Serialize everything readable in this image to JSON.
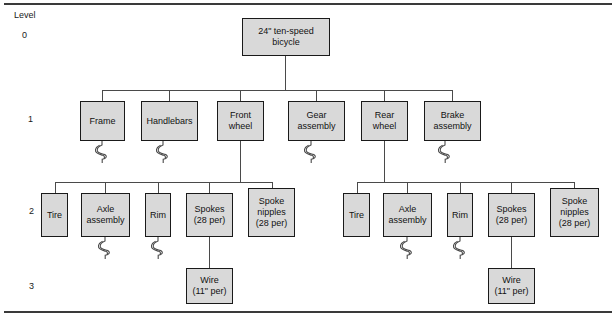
{
  "diagram": {
    "type": "product-structure-tree",
    "level_header": "Level",
    "levels": [
      {
        "id": "level-0",
        "label": "0",
        "x": 22,
        "y": 30
      },
      {
        "id": "level-1",
        "label": "1",
        "x": 28,
        "y": 114
      },
      {
        "id": "level-2",
        "label": "2",
        "x": 29,
        "y": 206
      },
      {
        "id": "level-3",
        "label": "3",
        "x": 29,
        "y": 281
      }
    ],
    "level_header_pos": {
      "x": 14,
      "y": 10
    },
    "nodes": [
      {
        "id": "root-bicycle",
        "name": "node-24in-ten-speed-bicycle",
        "label": "24\" ten-speed\nbicycle",
        "level": 0,
        "x": 242,
        "y": 18,
        "w": 88,
        "h": 38
      },
      {
        "id": "frame",
        "name": "node-frame",
        "label": "Frame",
        "level": 1,
        "x": 80,
        "y": 101,
        "w": 45,
        "h": 40
      },
      {
        "id": "handlebars",
        "name": "node-handlebars",
        "label": "Handlebars",
        "level": 1,
        "x": 141,
        "y": 101,
        "w": 57,
        "h": 40
      },
      {
        "id": "front-wheel",
        "name": "node-front-wheel",
        "label": "Front\nwheel",
        "level": 1,
        "x": 217,
        "y": 101,
        "w": 47,
        "h": 40
      },
      {
        "id": "gear-assembly",
        "name": "node-gear-assembly",
        "label": "Gear\nassembly",
        "level": 1,
        "x": 288,
        "y": 101,
        "w": 57,
        "h": 40
      },
      {
        "id": "rear-wheel",
        "name": "node-rear-wheel",
        "label": "Rear\nwheel",
        "level": 1,
        "x": 361,
        "y": 101,
        "w": 47,
        "h": 40
      },
      {
        "id": "brake-assembly",
        "name": "node-brake-assembly",
        "label": "Brake\nassembly",
        "level": 1,
        "x": 424,
        "y": 101,
        "w": 57,
        "h": 40
      },
      {
        "id": "tire-l",
        "name": "node-tire-front",
        "label": "Tire",
        "level": 2,
        "x": 41,
        "y": 193,
        "w": 27,
        "h": 44
      },
      {
        "id": "axle-l",
        "name": "node-axle-assembly-front",
        "label": "Axle\nassembly",
        "level": 2,
        "x": 81,
        "y": 193,
        "w": 49,
        "h": 44
      },
      {
        "id": "rim-l",
        "name": "node-rim-front",
        "label": "Rim",
        "level": 2,
        "x": 145,
        "y": 193,
        "w": 26,
        "h": 44
      },
      {
        "id": "spokes-l",
        "name": "node-spokes-front",
        "label": "Spokes\n(28 per)",
        "level": 2,
        "x": 186,
        "y": 193,
        "w": 47,
        "h": 44
      },
      {
        "id": "spoke-nipples-l",
        "name": "node-spoke-nipples-front",
        "label": "Spoke\nnipples\n(28 per)",
        "level": 2,
        "x": 248,
        "y": 188,
        "w": 47,
        "h": 49
      },
      {
        "id": "tire-r",
        "name": "node-tire-rear",
        "label": "Tire",
        "level": 2,
        "x": 343,
        "y": 193,
        "w": 27,
        "h": 44
      },
      {
        "id": "axle-r",
        "name": "node-axle-assembly-rear",
        "label": "Axle\nassembly",
        "level": 2,
        "x": 383,
        "y": 193,
        "w": 49,
        "h": 44
      },
      {
        "id": "rim-r",
        "name": "node-rim-rear",
        "label": "Rim",
        "level": 2,
        "x": 447,
        "y": 193,
        "w": 26,
        "h": 44
      },
      {
        "id": "spokes-r",
        "name": "node-spokes-rear",
        "label": "Spokes\n(28 per)",
        "level": 2,
        "x": 488,
        "y": 193,
        "w": 47,
        "h": 44
      },
      {
        "id": "spoke-nipples-r",
        "name": "node-spoke-nipples-rear",
        "label": "Spoke\nnipples\n(28 per)",
        "level": 2,
        "x": 550,
        "y": 188,
        "w": 49,
        "h": 49
      },
      {
        "id": "wire-l",
        "name": "node-wire-front",
        "label": "Wire\n(11\" per)",
        "level": 3,
        "x": 186,
        "y": 268,
        "w": 47,
        "h": 36
      },
      {
        "id": "wire-r",
        "name": "node-wire-rear",
        "label": "Wire\n(11\" per)",
        "level": 3,
        "x": 488,
        "y": 268,
        "w": 47,
        "h": 36
      }
    ],
    "edges": [
      {
        "id": "e-root-stem",
        "name": "edge-root-stem",
        "orient": "v",
        "x": 285,
        "y": 56,
        "len": 34
      },
      {
        "id": "e-bus-l1",
        "name": "edge-level1-bus",
        "orient": "h",
        "x": 102,
        "y": 90,
        "len": 351
      },
      {
        "id": "e-frame",
        "name": "edge-to-frame",
        "orient": "v",
        "x": 102,
        "y": 90,
        "len": 11
      },
      {
        "id": "e-handlebars",
        "name": "edge-to-handlebars",
        "orient": "v",
        "x": 169,
        "y": 90,
        "len": 11
      },
      {
        "id": "e-front-wheel",
        "name": "edge-to-front-wheel",
        "orient": "v",
        "x": 240,
        "y": 90,
        "len": 11
      },
      {
        "id": "e-gear",
        "name": "edge-to-gear-assembly",
        "orient": "v",
        "x": 316,
        "y": 90,
        "len": 11
      },
      {
        "id": "e-rear-wheel",
        "name": "edge-to-rear-wheel",
        "orient": "v",
        "x": 384,
        "y": 90,
        "len": 11
      },
      {
        "id": "e-brake",
        "name": "edge-to-brake-assembly",
        "orient": "v",
        "x": 452,
        "y": 90,
        "len": 11
      },
      {
        "id": "e-fw-stem",
        "name": "edge-front-wheel-stem",
        "orient": "v",
        "x": 240,
        "y": 141,
        "len": 41
      },
      {
        "id": "e-bus-l2a",
        "name": "edge-level2-bus-front",
        "orient": "h",
        "x": 55,
        "y": 182,
        "len": 218
      },
      {
        "id": "e-tire-l",
        "name": "edge-to-tire-front",
        "orient": "v",
        "x": 55,
        "y": 182,
        "len": 12
      },
      {
        "id": "e-axle-l",
        "name": "edge-to-axle-front",
        "orient": "v",
        "x": 105,
        "y": 182,
        "len": 12
      },
      {
        "id": "e-rim-l",
        "name": "edge-to-rim-front",
        "orient": "v",
        "x": 158,
        "y": 182,
        "len": 12
      },
      {
        "id": "e-spokes-l",
        "name": "edge-to-spokes-front",
        "orient": "v",
        "x": 209,
        "y": 182,
        "len": 12
      },
      {
        "id": "e-nipples-l",
        "name": "edge-to-nipples-front",
        "orient": "v",
        "x": 272,
        "y": 182,
        "len": 7
      },
      {
        "id": "e-wire-l",
        "name": "edge-to-wire-front",
        "orient": "v",
        "x": 209,
        "y": 237,
        "len": 32
      },
      {
        "id": "e-rw-stem",
        "name": "edge-rear-wheel-stem",
        "orient": "v",
        "x": 384,
        "y": 141,
        "len": 41
      },
      {
        "id": "e-bus-l2b",
        "name": "edge-level2-bus-rear",
        "orient": "h",
        "x": 357,
        "y": 182,
        "len": 218
      },
      {
        "id": "e-tire-r",
        "name": "edge-to-tire-rear",
        "orient": "v",
        "x": 357,
        "y": 182,
        "len": 12
      },
      {
        "id": "e-axle-r",
        "name": "edge-to-axle-rear",
        "orient": "v",
        "x": 407,
        "y": 182,
        "len": 12
      },
      {
        "id": "e-rim-r",
        "name": "edge-to-rim-rear",
        "orient": "v",
        "x": 460,
        "y": 182,
        "len": 12
      },
      {
        "id": "e-spokes-r",
        "name": "edge-to-spokes-rear",
        "orient": "v",
        "x": 511,
        "y": 182,
        "len": 12
      },
      {
        "id": "e-nipples-r",
        "name": "edge-to-nipples-rear",
        "orient": "v",
        "x": 574,
        "y": 182,
        "len": 7
      },
      {
        "id": "e-wire-r",
        "name": "edge-to-wire-rear",
        "orient": "v",
        "x": 511,
        "y": 237,
        "len": 32
      }
    ],
    "break_marks": [
      {
        "id": "bm-frame",
        "name": "break-symbol-frame",
        "x": 95,
        "y": 141
      },
      {
        "id": "bm-handlebars",
        "name": "break-symbol-handlebars",
        "x": 156,
        "y": 141
      },
      {
        "id": "bm-gear",
        "name": "break-symbol-gear-assembly",
        "x": 304,
        "y": 141
      },
      {
        "id": "bm-brake",
        "name": "break-symbol-brake-assembly",
        "x": 438,
        "y": 141
      },
      {
        "id": "bm-axle-l",
        "name": "break-symbol-axle-front",
        "x": 98,
        "y": 237
      },
      {
        "id": "bm-rim-l",
        "name": "break-symbol-rim-front",
        "x": 151,
        "y": 237
      },
      {
        "id": "bm-axle-r",
        "name": "break-symbol-axle-rear",
        "x": 400,
        "y": 237
      },
      {
        "id": "bm-rim-r",
        "name": "break-symbol-rim-rear",
        "x": 453,
        "y": 237
      }
    ],
    "colors": {
      "node_fill": "#d9d9d9",
      "node_border": "#1a1a1a",
      "edge": "#4a4a4a",
      "rule": "#3a3a3a",
      "text": "#111111",
      "background": "#ffffff"
    }
  }
}
